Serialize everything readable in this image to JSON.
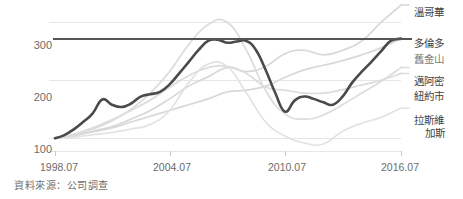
{
  "chart_data": {
    "type": "line",
    "title": "",
    "subtitle": "",
    "xlabel": "",
    "ylabel": "",
    "xlim": [
      1998.54,
      2016.54
    ],
    "ylim": [
      78,
      318
    ],
    "yticks": [
      100,
      200,
      300
    ],
    "ytick_labels": [
      "100",
      "200",
      "300"
    ],
    "xticks": [
      1998.54,
      2004.54,
      2010.54,
      2016.54
    ],
    "xtick_labels": [
      "1998.07",
      "2004.07",
      "2010.07",
      "2016.07"
    ],
    "grid": true,
    "grid_axis": "y",
    "legend": "right-of-plot-endpoints",
    "reference_line": {
      "value": 272,
      "orientation": "horizontal",
      "color": "#555555",
      "label": ""
    },
    "note": "Index, 1998.07 = 100",
    "series": [
      {
        "name": "溫哥華",
        "highlight": false,
        "color": "#d8d8d8",
        "end_value": 318,
        "x": [
          1998.54,
          1999.5,
          2000.5,
          2001.5,
          2002.5,
          2003.5,
          2004.5,
          2005.5,
          2006.5,
          2007.5,
          2008.5,
          2009.5,
          2010.5,
          2011.5,
          2012.5,
          2013.5,
          2014.5,
          2015.5,
          2016.54
        ],
        "values": [
          100,
          104,
          112,
          120,
          133,
          148,
          168,
          190,
          206,
          222,
          215,
          224,
          246,
          252,
          244,
          252,
          268,
          300,
          330
        ]
      },
      {
        "name": "多倫多",
        "highlight": false,
        "color": "#d8d8d8",
        "end_value": 262,
        "x": [
          1998.54,
          1999.5,
          2000.5,
          2001.5,
          2002.5,
          2003.5,
          2004.5,
          2005.5,
          2006.5,
          2007.5,
          2008.5,
          2009.5,
          2010.5,
          2011.5,
          2012.5,
          2013.5,
          2014.5,
          2015.5,
          2016.54
        ],
        "values": [
          100,
          105,
          111,
          118,
          128,
          138,
          148,
          158,
          168,
          180,
          183,
          190,
          205,
          218,
          226,
          234,
          244,
          256,
          272
        ]
      },
      {
        "name": "舊金山",
        "highlight": true,
        "color": "#4a4a4a",
        "end_value": 272,
        "x": [
          1998.54,
          1999.0,
          1999.5,
          2000.0,
          2000.5,
          2001.0,
          2001.5,
          2002.0,
          2002.5,
          2003.0,
          2003.5,
          2004.0,
          2004.5,
          2005.0,
          2005.5,
          2006.0,
          2006.5,
          2007.0,
          2007.5,
          2008.0,
          2008.5,
          2009.0,
          2009.5,
          2010.0,
          2010.5,
          2011.0,
          2011.5,
          2012.0,
          2012.5,
          2013.0,
          2013.5,
          2014.0,
          2014.5,
          2015.0,
          2015.5,
          2016.0,
          2016.54
        ],
        "values": [
          100,
          105,
          115,
          128,
          143,
          167,
          158,
          154,
          160,
          172,
          176,
          180,
          193,
          212,
          232,
          252,
          268,
          270,
          265,
          267,
          268,
          252,
          218,
          178,
          146,
          165,
          172,
          168,
          162,
          158,
          172,
          196,
          215,
          232,
          250,
          268,
          272
        ]
      },
      {
        "name": "邁阿密",
        "highlight": false,
        "color": "#dcdcdc",
        "end_value": 228,
        "x": [
          1998.54,
          1999.5,
          2000.5,
          2001.5,
          2002.5,
          2003.5,
          2004.5,
          2005.5,
          2006.5,
          2007.5,
          2008.5,
          2009.5,
          2010.5,
          2011.5,
          2012.5,
          2013.5,
          2014.5,
          2015.5,
          2016.54
        ],
        "values": [
          100,
          106,
          116,
          130,
          150,
          178,
          215,
          262,
          296,
          300,
          252,
          182,
          142,
          133,
          140,
          158,
          178,
          198,
          222
        ]
      },
      {
        "name": "紐約市",
        "highlight": false,
        "color": "#dcdcdc",
        "end_value": 210,
        "x": [
          1998.54,
          1999.5,
          2000.5,
          2001.5,
          2002.5,
          2003.5,
          2004.5,
          2005.5,
          2006.5,
          2007.5,
          2008.5,
          2009.5,
          2010.5,
          2011.5,
          2012.5,
          2013.5,
          2014.5,
          2015.5,
          2016.54
        ],
        "values": [
          100,
          107,
          118,
          132,
          148,
          166,
          188,
          208,
          222,
          224,
          212,
          188,
          183,
          178,
          178,
          184,
          192,
          200,
          212
        ]
      },
      {
        "name": "拉斯維加斯",
        "highlight": false,
        "color": "#e2e2e2",
        "end_value": 158,
        "x": [
          1998.54,
          1999.5,
          2000.5,
          2001.5,
          2002.5,
          2003.5,
          2004.5,
          2005.5,
          2006.5,
          2007.5,
          2008.5,
          2009.5,
          2010.5,
          2011.5,
          2012.5,
          2013.5,
          2014.5,
          2015.5,
          2016.54
        ],
        "values": [
          100,
          102,
          106,
          110,
          116,
          124,
          148,
          196,
          228,
          224,
          178,
          128,
          104,
          92,
          90,
          112,
          126,
          136,
          152
        ]
      }
    ]
  },
  "axes": {
    "y_ticks": [
      {
        "label": "300",
        "value": 300
      },
      {
        "label": "200",
        "value": 200
      },
      {
        "label": "100",
        "value": 100
      }
    ],
    "x_ticks": [
      {
        "label": "1998.07",
        "value": 1998.54
      },
      {
        "label": "2004.07",
        "value": 2004.54
      },
      {
        "label": "2010.07",
        "value": 2010.54
      },
      {
        "label": "2016.07",
        "value": 2016.54
      }
    ]
  },
  "series_labels": [
    {
      "name": "溫哥華",
      "line1": "溫哥華",
      "line2": "",
      "top": 6,
      "highlight": false
    },
    {
      "name": "多倫多",
      "line1": "多倫多",
      "line2": "",
      "top": 37,
      "highlight": false
    },
    {
      "name": "舊金山",
      "line1": "舊金山",
      "line2": "",
      "top": 53,
      "highlight": true
    },
    {
      "name": "邁阿密",
      "line1": "邁阿密",
      "line2": "",
      "top": 75,
      "highlight": false
    },
    {
      "name": "紐約市",
      "line1": "紐約市",
      "line2": "",
      "top": 90,
      "highlight": false
    },
    {
      "name": "拉斯維加斯",
      "line1": "拉斯維",
      "line2": "加斯",
      "top": 114,
      "highlight": false
    }
  ],
  "footer": {
    "source": "資料來源：公司調查"
  },
  "colors": {
    "highlight_line": "#4a4a4a",
    "muted_line": "#dcdcdc",
    "reference_line": "#555555",
    "gridline": "#e6e6e6",
    "axis_text": "#6b6b6b",
    "label_text": "#3f3f3f",
    "background": "#ffffff"
  }
}
